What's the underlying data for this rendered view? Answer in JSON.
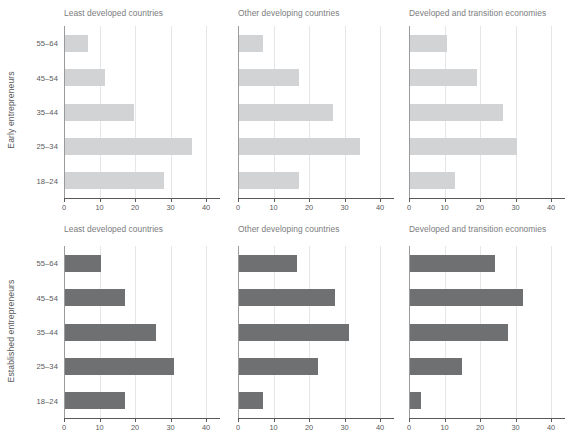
{
  "chart_data": {
    "type": "bar",
    "title": "",
    "orientation": "horizontal",
    "grid": true,
    "legend": false,
    "xlabel": "",
    "ylabel": "",
    "xlim": [
      0,
      45
    ],
    "xticks": [
      0,
      10,
      20,
      30,
      40
    ],
    "categories": [
      "18–24",
      "25–34",
      "35–44",
      "45–54",
      "55–64"
    ],
    "panel_rows": [
      {
        "row_label": "Early entrepreneurs",
        "bar_color": "#d2d3d4",
        "panels": [
          {
            "title": "Least developed countries",
            "values": [
              28.0,
              35.8,
              19.5,
              11.4,
              6.4
            ]
          },
          {
            "title": "Other developing countries",
            "values": [
              17.0,
              34.2,
              26.5,
              16.9,
              6.8
            ]
          },
          {
            "title": "Developed and transition economies",
            "values": [
              12.8,
              30.2,
              26.1,
              19.0,
              10.5
            ]
          }
        ]
      },
      {
        "row_label": "Established entrepreneurs",
        "bar_color": "#6f7072",
        "panels": [
          {
            "title": "Least developed countries",
            "values": [
              17.0,
              30.7,
              25.5,
              17.0,
              10.1
            ]
          },
          {
            "title": "Other developing countries",
            "values": [
              6.9,
              22.2,
              30.9,
              27.1,
              16.4
            ]
          },
          {
            "title": "Developed and transition economies",
            "values": [
              3.1,
              14.7,
              27.6,
              31.9,
              23.9
            ]
          }
        ]
      }
    ]
  },
  "colors": {
    "early_bar": "#d2d3d4",
    "established_bar": "#6f7072",
    "gridline": "#e6e6e6",
    "axis": "#58595b",
    "title_text": "#7b7c7e"
  }
}
